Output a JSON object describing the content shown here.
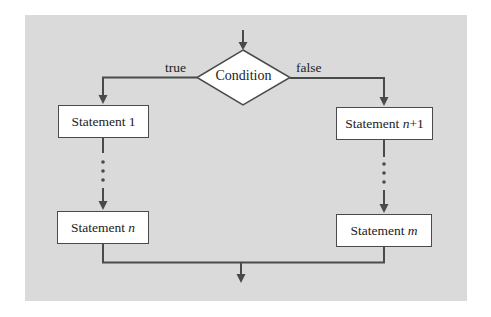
{
  "diagram": {
    "type": "flowchart",
    "title": "",
    "colors": {
      "panel": "#dadada",
      "line": "#4a4a4a",
      "box_fill": "#ffffff",
      "text": "#222222"
    },
    "decision": {
      "label": "Condition"
    },
    "branches": {
      "true_label": "true",
      "false_label": "false"
    },
    "left_column": {
      "first": {
        "prefix": "Statement",
        "suffix": "1",
        "suffix_italic": false
      },
      "ellipsis": "⋮",
      "last": {
        "prefix": "Statement",
        "suffix": "n",
        "suffix_italic": true
      }
    },
    "right_column": {
      "first": {
        "prefix": "Statement",
        "suffix_var": "n",
        "suffix_rest": "+1"
      },
      "ellipsis": "⋮",
      "last": {
        "prefix": "Statement",
        "suffix": "m",
        "suffix_italic": true
      }
    },
    "edges": [
      {
        "from": "entry",
        "to": "Condition"
      },
      {
        "from": "Condition",
        "to": "Statement 1",
        "label": "true"
      },
      {
        "from": "Condition",
        "to": "Statement n+1",
        "label": "false"
      },
      {
        "from": "Statement 1",
        "to": "Statement n",
        "style": "ellipsis"
      },
      {
        "from": "Statement n+1",
        "to": "Statement m",
        "style": "ellipsis"
      },
      {
        "from": "Statement n",
        "to": "exit"
      },
      {
        "from": "Statement m",
        "to": "exit"
      }
    ]
  }
}
